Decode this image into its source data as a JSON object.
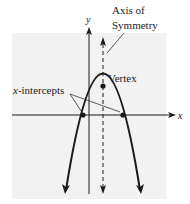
{
  "diagram": {
    "labels": {
      "y_axis": "y",
      "x_axis": "x",
      "axis_of_symmetry_line1": "Axis of",
      "axis_of_symmetry_line2": "Symmetry",
      "vertex": "Vertex",
      "x_intercepts_var": "x",
      "x_intercepts_rest": "-intercepts"
    },
    "colors": {
      "background_panel": "#f2f2f2",
      "stroke": "#1a1a1a",
      "leader": "#333333"
    },
    "geometry": {
      "vertex": [
        103,
        86
      ],
      "x_intercepts": [
        [
          83,
          115
        ],
        [
          123,
          115
        ]
      ],
      "x_axis_y": 115,
      "y_axis_x": 89,
      "symmetry_axis_x": 103
    }
  }
}
